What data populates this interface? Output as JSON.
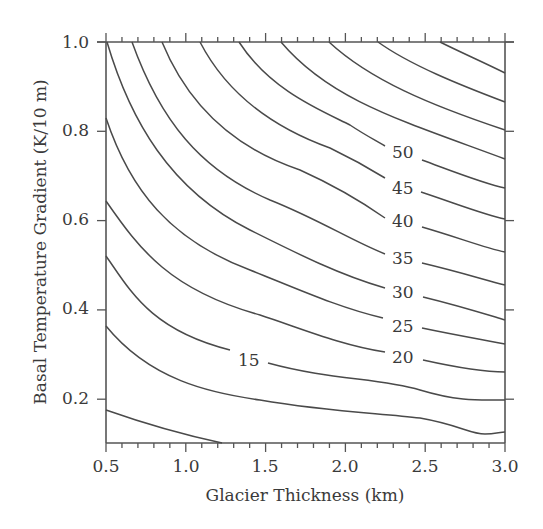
{
  "chart_data": {
    "type": "contour",
    "title": "",
    "xlabel": "Glacier Thickness (km)",
    "ylabel": "Basal Temperature Gradient (K/10 m)",
    "xlim": [
      0.5,
      3.0
    ],
    "ylim": [
      0.1,
      1.0
    ],
    "x_ticks": [
      "0.5",
      "1.0",
      "1.5",
      "2.0",
      "2.5",
      "3.0"
    ],
    "y_ticks": [
      "0.2",
      "0.4",
      "0.6",
      "0.8",
      "1.0"
    ],
    "grid": false,
    "contour_labels": [
      "15",
      "20",
      "25",
      "30",
      "35",
      "40",
      "45",
      "50"
    ],
    "contours": [
      {
        "level": null,
        "points": [
          [
            0.5,
            0.175
          ],
          [
            0.8,
            0.13
          ],
          [
            1.15,
            0.1
          ]
        ]
      },
      {
        "level": null,
        "points": [
          [
            0.5,
            0.36
          ],
          [
            0.8,
            0.27
          ],
          [
            1.2,
            0.22
          ],
          [
            1.8,
            0.175
          ],
          [
            2.3,
            0.16
          ],
          [
            2.8,
            0.125
          ],
          [
            3.0,
            0.125
          ]
        ]
      },
      {
        "level": 15,
        "points": [
          [
            0.5,
            0.52
          ],
          [
            0.75,
            0.42
          ],
          [
            1.1,
            0.33
          ],
          [
            1.5,
            0.27
          ],
          [
            2.0,
            0.24
          ],
          [
            2.6,
            0.2
          ],
          [
            3.0,
            0.195
          ]
        ]
      },
      {
        "level": 20,
        "points": [
          [
            0.5,
            0.64
          ],
          [
            0.8,
            0.52
          ],
          [
            1.2,
            0.43
          ],
          [
            1.8,
            0.35
          ],
          [
            2.5,
            0.31
          ],
          [
            3.0,
            0.26
          ]
        ]
      },
      {
        "level": 25,
        "points": [
          [
            0.5,
            0.825
          ],
          [
            0.8,
            0.66
          ],
          [
            1.3,
            0.52
          ],
          [
            2.0,
            0.41
          ],
          [
            2.6,
            0.36
          ],
          [
            3.0,
            0.325
          ]
        ]
      },
      {
        "level": 30,
        "points": [
          [
            0.5,
            1.0
          ],
          [
            0.8,
            0.8
          ],
          [
            1.3,
            0.62
          ],
          [
            2.0,
            0.49
          ],
          [
            2.6,
            0.42
          ],
          [
            3.0,
            0.38
          ]
        ]
      },
      {
        "level": 35,
        "points": [
          [
            0.65,
            1.0
          ],
          [
            1.0,
            0.8
          ],
          [
            1.6,
            0.62
          ],
          [
            2.2,
            0.52
          ],
          [
            3.0,
            0.455
          ]
        ]
      },
      {
        "level": 40,
        "points": [
          [
            0.8,
            1.0
          ],
          [
            1.2,
            0.82
          ],
          [
            1.8,
            0.66
          ],
          [
            2.4,
            0.58
          ],
          [
            3.0,
            0.53
          ]
        ]
      },
      {
        "level": 45,
        "points": [
          [
            1.0,
            1.0
          ],
          [
            1.5,
            0.84
          ],
          [
            2.1,
            0.72
          ],
          [
            2.6,
            0.65
          ],
          [
            3.0,
            0.6
          ]
        ]
      },
      {
        "level": 50,
        "points": [
          [
            1.2,
            1.0
          ],
          [
            1.7,
            0.88
          ],
          [
            2.3,
            0.76
          ],
          [
            3.0,
            0.67
          ]
        ]
      },
      {
        "level": null,
        "points": [
          [
            1.45,
            1.0
          ],
          [
            2.1,
            0.88
          ],
          [
            3.0,
            0.735
          ]
        ]
      },
      {
        "level": null,
        "points": [
          [
            1.75,
            1.0
          ],
          [
            2.5,
            0.89
          ],
          [
            3.0,
            0.8
          ]
        ]
      },
      {
        "level": null,
        "points": [
          [
            2.05,
            1.0
          ],
          [
            2.6,
            0.92
          ],
          [
            3.0,
            0.865
          ]
        ]
      },
      {
        "level": null,
        "points": [
          [
            2.4,
            1.0
          ],
          [
            2.8,
            0.96
          ],
          [
            3.0,
            0.93
          ]
        ]
      }
    ]
  }
}
